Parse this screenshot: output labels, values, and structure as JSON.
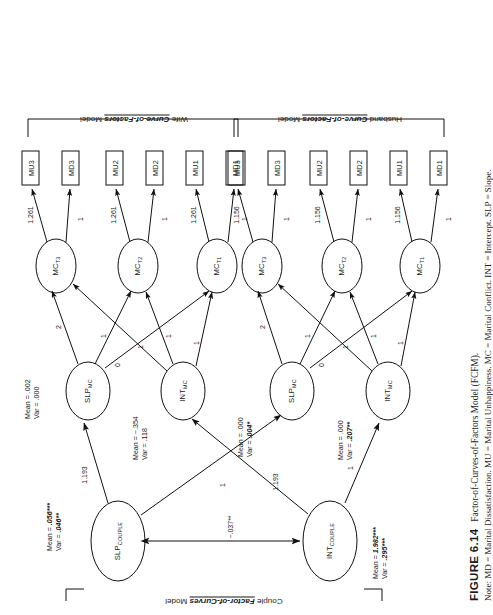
{
  "figure": {
    "number": "FIGURE 6.14",
    "title": "Factor-of-Curves-of-Factors Model (FCFM).",
    "note": "Note: MD = Marital Dissatisfaction. MU = Marital Unhappiness. MC = Marital Conflict. INT = Intercept. SLP = Slope."
  },
  "groups": {
    "couple": {
      "prefix": "Couple ",
      "emph": "Factor-of-Curves",
      "suffix": " Model"
    },
    "wife": {
      "prefix": "Wife ",
      "emph": "Curve-of-Factors",
      "suffix": " Model"
    },
    "husband": {
      "prefix": "Husband ",
      "emph": "Curve-of-Factors",
      "suffix": " Model"
    }
  },
  "nodes": {
    "slp_couple": {
      "label": "SLP",
      "sub": "COUPLE"
    },
    "int_couple": {
      "label": "INT",
      "sub": "COUPLE"
    },
    "wife_slp_mc": {
      "label": "SLP",
      "sub": "MC"
    },
    "wife_int_mc": {
      "label": "INT",
      "sub": "MC"
    },
    "husb_slp_mc": {
      "label": "SLP",
      "sub": "MC"
    },
    "husb_int_mc": {
      "label": "INT",
      "sub": "MC"
    },
    "wife_mc_t1": {
      "label": "MC",
      "sub": "T1"
    },
    "wife_mc_t2": {
      "label": "MC",
      "sub": "T2"
    },
    "wife_mc_t3": {
      "label": "MC",
      "sub": "T3"
    },
    "husb_mc_t1": {
      "label": "MC",
      "sub": "T1"
    },
    "husb_mc_t2": {
      "label": "MC",
      "sub": "T2"
    },
    "husb_mc_t3": {
      "label": "MC",
      "sub": "T3"
    }
  },
  "indicators": {
    "wife": [
      "MD1",
      "MU1",
      "MD2",
      "MU2",
      "MD3",
      "MU3"
    ],
    "husband": [
      "MD1",
      "MU1",
      "MD2",
      "MU2",
      "MD3",
      "MU3"
    ]
  },
  "stats": {
    "slp_couple": {
      "mean_label": "Mean = ",
      "mean": ".056***",
      "var_label": "Var = ",
      "var": ".046**"
    },
    "int_couple": {
      "mean_label": "Mean = ",
      "mean": "1.982***",
      "var_label": "Var = ",
      "var": ".295***"
    },
    "wife_slp_mc": {
      "mean_label": "Mean = ",
      "mean": ".002",
      "var_label": "Var = ",
      "var": ".000"
    },
    "wife_int_mc": {
      "mean_label": "Mean = ",
      "mean": "−.354",
      "var_label": "Var = ",
      "var": ".118"
    },
    "husb_slp_mc": {
      "mean_label": "Mean = ",
      "mean": ".000",
      "var_label": "Var = ",
      "var": ".004*"
    },
    "husb_int_mc": {
      "mean_label": "Mean = ",
      "mean": ".000",
      "var_label": "Var = ",
      "var": ".207**"
    }
  },
  "paths": {
    "couple_covariance": "−.037**",
    "slp_couple_to_wife_slp": "1.193",
    "slp_couple_to_husb_slp": "1",
    "int_couple_to_wife_int": "1.193",
    "int_couple_to_husb_int": "1",
    "slope_loadings": [
      "0",
      "1",
      "2"
    ],
    "intercept_loadings": [
      "1",
      "1",
      "1"
    ],
    "wife_mu_loading": "1.261",
    "wife_md_loading": "1",
    "husb_mu_loading": "1.156",
    "husb_md_loading": "1"
  }
}
